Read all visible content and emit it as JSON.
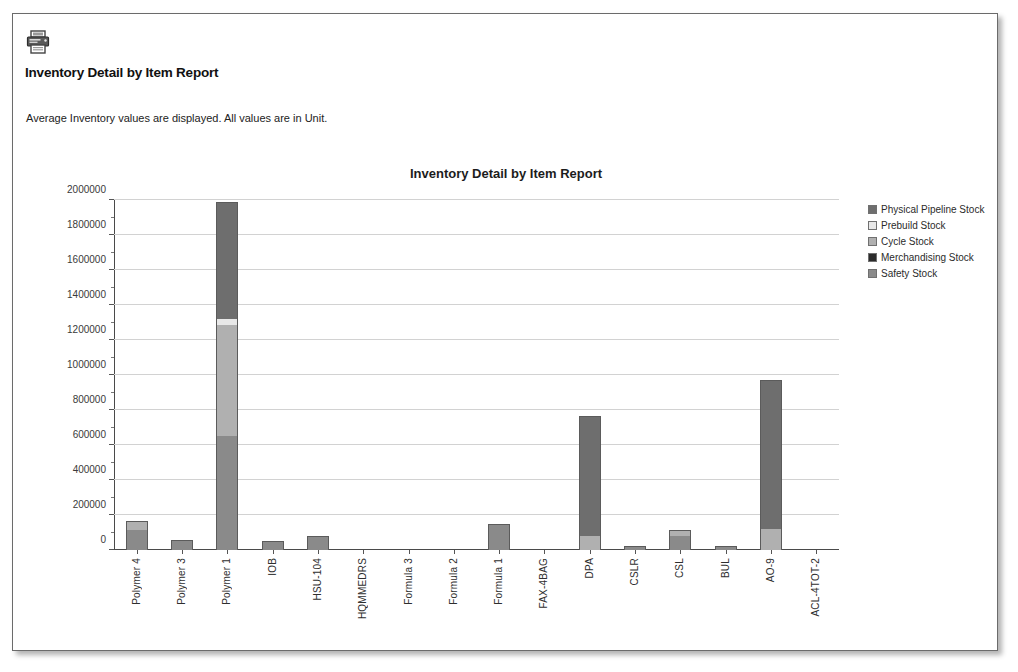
{
  "toolbar": {
    "print_icon": "printer-icon"
  },
  "header": {
    "title": "Inventory Detail by Item Report",
    "subtitle": "Average Inventory values are displayed. All values are in Unit."
  },
  "colors": {
    "physical_pipeline_stock": "#6e6e6e",
    "prebuild_stock": "#e8e8e8",
    "cycle_stock": "#b0b0b0",
    "merchandising_stock": "#2b2b2b",
    "safety_stock": "#8a8a8a",
    "grid": "#d2d2d2",
    "axis": "#4a4a4a",
    "page_border": "#6b6b6b"
  },
  "chart_data": {
    "type": "bar",
    "stacked": true,
    "title": "Inventory Detail by Item Report",
    "xlabel": "",
    "ylabel": "",
    "ylim": [
      0,
      2000000
    ],
    "ytick_step": 200000,
    "yticks": [
      0,
      200000,
      400000,
      600000,
      800000,
      1000000,
      1200000,
      1400000,
      1600000,
      1800000,
      2000000
    ],
    "ytick_labels": [
      "0",
      "200000",
      "400000",
      "600000",
      "800000",
      "1000000",
      "1200000",
      "1400000",
      "1600000",
      "1800000",
      "2000000"
    ],
    "grid": true,
    "legend_position": "right",
    "categories": [
      "Polymer 4",
      "Polymer 3",
      "Polymer 1",
      "IOB",
      "HSU-104",
      "HQMMEDRS",
      "Formula 3",
      "Formula 2",
      "Formula 1",
      "FAX-4BAG",
      "DPA",
      "CSLR",
      "CSL",
      "BUL",
      "AO-9",
      "ACL-4TOT-2"
    ],
    "series": [
      {
        "name": "Safety Stock",
        "color": "#8a8a8a",
        "values": [
          115000,
          50000,
          650000,
          48000,
          72000,
          0,
          0,
          0,
          145000,
          0,
          0,
          15000,
          78000,
          18000,
          0,
          0
        ]
      },
      {
        "name": "Merchandising Stock",
        "color": "#2b2b2b",
        "values": [
          0,
          0,
          0,
          0,
          0,
          0,
          0,
          0,
          0,
          0,
          0,
          0,
          0,
          0,
          0,
          0
        ]
      },
      {
        "name": "Cycle Stock",
        "color": "#b0b0b0",
        "values": [
          45000,
          0,
          635000,
          0,
          0,
          0,
          0,
          0,
          0,
          0,
          80000,
          0,
          32000,
          0,
          120000,
          0
        ]
      },
      {
        "name": "Prebuild Stock",
        "color": "#e8e8e8",
        "values": [
          0,
          0,
          35000,
          0,
          0,
          0,
          0,
          0,
          0,
          0,
          0,
          0,
          0,
          0,
          0,
          0
        ]
      },
      {
        "name": "Physical Pipeline Stock",
        "color": "#6e6e6e",
        "values": [
          0,
          0,
          665000,
          0,
          0,
          0,
          0,
          0,
          0,
          0,
          680000,
          0,
          0,
          0,
          845000,
          0
        ]
      }
    ],
    "totals": [
      160000,
      50000,
      1985000,
      48000,
      72000,
      0,
      0,
      0,
      145000,
      0,
      760000,
      15000,
      110000,
      18000,
      965000,
      0
    ]
  },
  "legend": {
    "items": [
      {
        "label": "Physical Pipeline Stock",
        "color": "#6e6e6e"
      },
      {
        "label": "Prebuild Stock",
        "color": "#e8e8e8"
      },
      {
        "label": "Cycle Stock",
        "color": "#b0b0b0"
      },
      {
        "label": "Merchandising Stock",
        "color": "#2b2b2b"
      },
      {
        "label": "Safety Stock",
        "color": "#8a8a8a"
      }
    ]
  }
}
